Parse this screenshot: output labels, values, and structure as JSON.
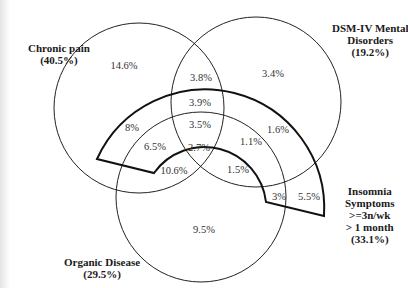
{
  "sets": {
    "chronic_pain": {
      "name": "Chronic pain",
      "pct": "(40.5%)"
    },
    "dsm": {
      "name_line1": "DSM-IV Mental",
      "name_line2": "Disorders",
      "pct": "(19.2%)"
    },
    "organic": {
      "name": "Organic Disease",
      "pct": "(29.5%)"
    },
    "insomnia": {
      "line1": "Insomnia",
      "line2": "Symptoms",
      "line3": ">=3n/wk",
      "line4": "> 1 month",
      "pct": "(33.1%)"
    }
  },
  "regions": {
    "pain_only": "14.6%",
    "dsm_only": "3.4%",
    "pain_dsm": "3.8%",
    "pain_dsm_insomnia": "3.9%",
    "all_four": "3.5%",
    "pain_dsm_organic": "2.7%",
    "pain_insomnia": "8%",
    "pain_organic_insomnia": "6.5%",
    "pain_organic": "10.6%",
    "dsm_insomnia": "1.6%",
    "dsm_organic_insomnia": "1.1%",
    "dsm_organic": "1.5%",
    "organic_insomnia": "3%",
    "insomnia_only": "5.5%",
    "organic_only": "9.5%"
  }
}
